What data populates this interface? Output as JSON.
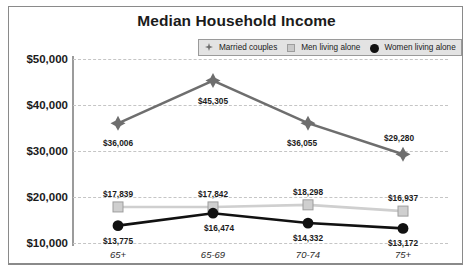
{
  "chart_data": {
    "type": "line",
    "title": "Median Household Income",
    "xlabel": "",
    "ylabel": "",
    "categories": [
      "65+",
      "65-69",
      "70-74",
      "75+"
    ],
    "ylim": [
      10000,
      50000
    ],
    "ytick_labels": [
      "$50,000",
      "$40,000",
      "$30,000",
      "$20,000",
      "$10,000"
    ],
    "ytick_values": [
      50000,
      40000,
      30000,
      20000,
      10000
    ],
    "grid": true,
    "legend_position": "top-center",
    "series": [
      {
        "name": "Married couples",
        "marker": "diamond",
        "color": "#6e6e6e",
        "values": [
          36006,
          45305,
          36055,
          29280
        ],
        "labels": [
          "$36,006",
          "$45,305",
          "$36,055",
          "$29,280"
        ]
      },
      {
        "name": "Men living alone",
        "marker": "square",
        "color": "#c9c9c9",
        "values": [
          17839,
          17842,
          18298,
          16937
        ],
        "labels": [
          "$17,839",
          "$17,842",
          "$18,298",
          "$16,937"
        ]
      },
      {
        "name": "Women living alone",
        "marker": "circle",
        "color": "#111111",
        "values": [
          13775,
          16474,
          14332,
          13172
        ],
        "labels": [
          "$13,775",
          "$16,474",
          "$14,332",
          "$13,172"
        ]
      }
    ]
  },
  "legend": {
    "items": [
      {
        "label": "Married couples",
        "icon": "diamond-marker-icon"
      },
      {
        "label": "Men living alone",
        "icon": "square-marker-icon"
      },
      {
        "label": "Women living alone",
        "icon": "circle-marker-icon"
      }
    ]
  }
}
